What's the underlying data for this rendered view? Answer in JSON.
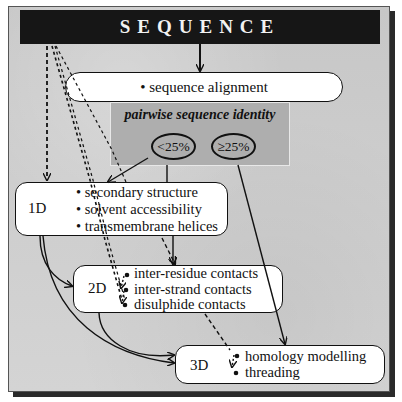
{
  "title": "SEQUENCE",
  "alignment": {
    "label": "• sequence alignment"
  },
  "pairwise": {
    "title": "pairwise sequence identity",
    "low": "<25%",
    "high": "≥25%"
  },
  "levels": [
    {
      "id": "1D",
      "label": "1D",
      "items": [
        "• secondary structure",
        "• solvent accessibility",
        "• transmembrane helices"
      ]
    },
    {
      "id": "2D",
      "label": "2D",
      "items": [
        "inter-residue contacts",
        "inter-strand contacts",
        "disulphide contacts"
      ]
    },
    {
      "id": "3D",
      "label": "3D",
      "items": [
        "homology modelling",
        "threading"
      ]
    }
  ],
  "colors": {
    "background": "#c9c9c9",
    "titlebar": "#161616",
    "panel": "#aeaeae",
    "box": "#ffffff",
    "line": "#111111"
  }
}
